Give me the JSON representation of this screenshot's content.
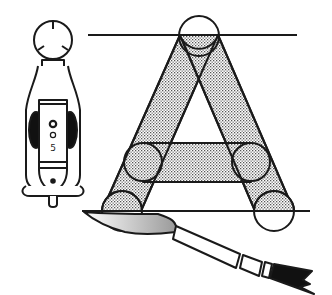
{
  "illustration": {
    "subject": "Letter A construction with brush and lettering tool",
    "letter": "A",
    "tool_marking": {
      "top": "O",
      "middle": "O",
      "bottom": "5"
    },
    "colors": {
      "ink": "#1a1a1a",
      "paper": "#ffffff",
      "stipple": "#bdbdbd",
      "brush_tip": "#c8c8c8"
    }
  }
}
